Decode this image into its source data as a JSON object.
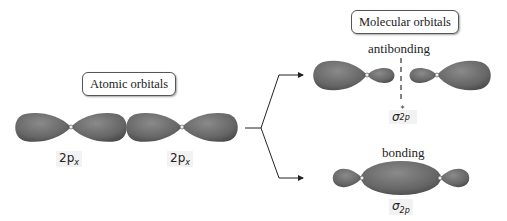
{
  "atomic": {
    "title": "Atomic orbitals",
    "orbital_labels": [
      "2p",
      "2p"
    ],
    "subscript": "x"
  },
  "molecular": {
    "title": "Molecular orbitals",
    "antibonding": {
      "label": "antibonding",
      "symbol": "σ",
      "superscript": "*",
      "subscript": "2p"
    },
    "bonding": {
      "label": "bonding",
      "symbol": "σ",
      "subscript": "2p"
    }
  },
  "colors": {
    "lobe": "#6e6e6e",
    "lobe_dark": "#4a4a4a",
    "line": "#222222"
  }
}
